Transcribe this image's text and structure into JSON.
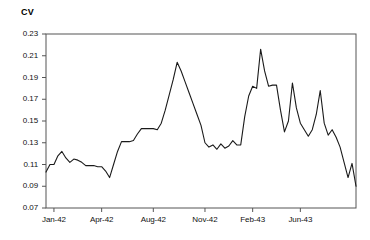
{
  "chart_data": {
    "type": "line",
    "title": "",
    "ylabel": "CV",
    "xlabel": "",
    "ylim": [
      0.07,
      0.23
    ],
    "ytick_labels": [
      "0.23",
      "0.21",
      "0.19",
      "0.17",
      "0.15",
      "0.13",
      "0.11",
      "0.09",
      "0.07"
    ],
    "ytick_values": [
      0.23,
      0.21,
      0.19,
      0.17,
      0.15,
      0.13,
      0.11,
      0.09,
      0.07
    ],
    "xtick_labels": [
      "Jan-42",
      "Apr-42",
      "Aug-42",
      "Nov-42",
      "Feb-43",
      "Jun-43"
    ],
    "xtick_positions": [
      2,
      14,
      27,
      40,
      52,
      64
    ],
    "grid": false,
    "legend": false,
    "line_color": "#1a1a1a",
    "series": [
      {
        "name": "CV",
        "x": [
          0,
          1,
          2,
          3,
          4,
          5,
          6,
          7,
          8,
          9,
          10,
          11,
          12,
          13,
          14,
          15,
          16,
          17,
          18,
          19,
          20,
          21,
          22,
          23,
          24,
          25,
          26,
          27,
          28,
          29,
          30,
          31,
          32,
          33,
          34,
          35,
          36,
          37,
          38,
          39,
          40,
          41,
          42,
          43,
          44,
          45,
          46,
          47,
          48,
          49,
          50,
          51,
          52,
          53,
          54,
          55,
          56,
          57,
          58,
          59,
          60,
          61,
          62,
          63,
          64,
          65,
          66,
          67,
          68,
          69,
          70,
          71,
          72,
          73,
          74,
          75,
          76,
          77,
          78
        ],
        "values": [
          0.103,
          0.11,
          0.11,
          0.118,
          0.122,
          0.116,
          0.112,
          0.115,
          0.114,
          0.112,
          0.109,
          0.109,
          0.109,
          0.108,
          0.108,
          0.104,
          0.098,
          0.11,
          0.122,
          0.131,
          0.131,
          0.131,
          0.132,
          0.138,
          0.143,
          0.143,
          0.143,
          0.143,
          0.142,
          0.148,
          0.16,
          0.174,
          0.188,
          0.204,
          0.196,
          0.186,
          0.176,
          0.166,
          0.156,
          0.146,
          0.13,
          0.126,
          0.128,
          0.124,
          0.129,
          0.125,
          0.127,
          0.132,
          0.128,
          0.128,
          0.154,
          0.173,
          0.182,
          0.18,
          0.216,
          0.196,
          0.182,
          0.183,
          0.183,
          0.16,
          0.14,
          0.15,
          0.185,
          0.162,
          0.148,
          0.142,
          0.136,
          0.142,
          0.156,
          0.178,
          0.148,
          0.137,
          0.142,
          0.135,
          0.126,
          0.112,
          0.098,
          0.111,
          0.09
        ]
      }
    ]
  },
  "axes": {
    "y_axis_name": "CV",
    "frame_color": "#555555"
  }
}
